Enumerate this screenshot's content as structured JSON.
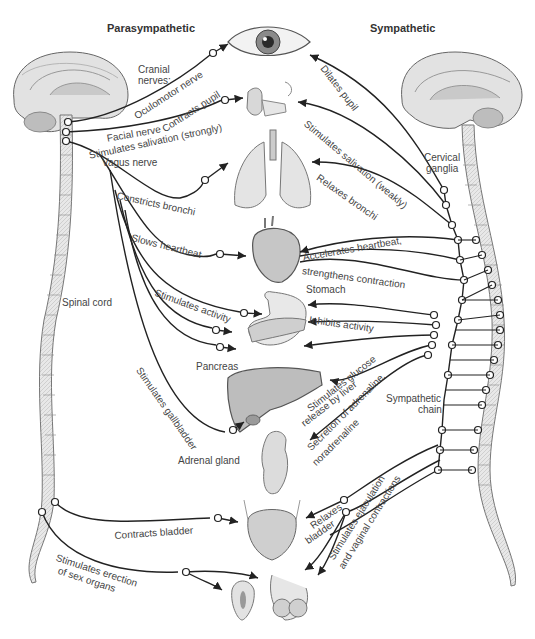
{
  "headers": {
    "parasympathetic": "Parasympathetic",
    "sympathetic": "Sympathetic"
  },
  "structures": {
    "cranial_nerves_line1": "Cranial",
    "cranial_nerves_line2": "nerves:",
    "oculomotor_nerve": "Oculomotor nerve",
    "facial_nerve": "Facial nerve",
    "vagus_nerve": "Vagus nerve",
    "spinal_cord": "Spinal cord",
    "cervical_ganglia_line1": "Cervical",
    "cervical_ganglia_line2": "ganglia",
    "sympathetic_chain_line1": "Sympathetic",
    "sympathetic_chain_line2": "chain",
    "stomach": "Stomach",
    "pancreas": "Pancreas",
    "adrenal_gland": "Adrenal gland"
  },
  "parasympathetic_effects": [
    {
      "target": "eye",
      "label": "Contracts pupil"
    },
    {
      "target": "salivary glands",
      "label": "Stimulates salivation (strongly)"
    },
    {
      "target": "lungs",
      "label": "Constricts bronchi"
    },
    {
      "target": "heart",
      "label": "Slows heartbeat"
    },
    {
      "target": "stomach",
      "label": "Stimulates activity"
    },
    {
      "target": "gallbladder",
      "label": "Stimulates gallbladder"
    },
    {
      "target": "bladder",
      "label": "Contracts bladder"
    },
    {
      "target": "sex organs",
      "label_line1": "Stimulates erection",
      "label_line2": "of sex organs"
    }
  ],
  "sympathetic_effects": [
    {
      "target": "eye",
      "label": "Dilates pupil"
    },
    {
      "target": "salivary glands",
      "label": "Stimulates salivation (weakly)"
    },
    {
      "target": "lungs",
      "label": "Relaxes bronchi"
    },
    {
      "target": "heart",
      "label_line1": "Accelerates heartbeat,",
      "label_line2": "strengthens contraction"
    },
    {
      "target": "stomach",
      "label": "Inhibits activity"
    },
    {
      "target": "liver",
      "label_line1": "Stimulates glucose",
      "label_line2": "release by liver"
    },
    {
      "target": "adrenal gland",
      "label_line1": "Secretion of adrenaline,",
      "label_line2": "noradrenaline"
    },
    {
      "target": "bladder",
      "label_line1": "Relaxes",
      "label_line2": "bladder"
    },
    {
      "target": "sex organs",
      "label_line1": "Stimulates ejaculation",
      "label_line2": "and vaginal contractions"
    }
  ],
  "colors": {
    "nerve": "#222222",
    "spine_fill": "#e4e4e4",
    "organ_fill": "#d8d8d8",
    "brain_fill": "#dcdcdc",
    "text": "#444444"
  }
}
